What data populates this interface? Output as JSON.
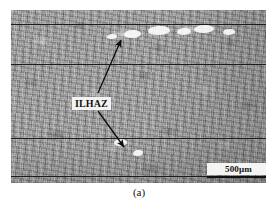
{
  "figure": {
    "caption": "(a)",
    "type": "optical-micrograph"
  },
  "micrograph": {
    "annotations": {
      "ilhaz_label": "ILHAZ",
      "ilhaz_pointer_count": 2
    },
    "scale_bar": {
      "label": "500μm",
      "value": "500",
      "unit": "μm"
    },
    "interface_lines": [
      {
        "name": "bead-boundary-1",
        "y": 14
      },
      {
        "name": "bead-boundary-2",
        "y": 54
      },
      {
        "name": "bead-boundary-3",
        "y": 128
      },
      {
        "name": "bead-boundary-4",
        "y": 166
      }
    ],
    "arrows": [
      {
        "name": "ilhaz-arrow-upper",
        "from": [
          87,
          83
        ],
        "to": [
          110,
          30
        ]
      },
      {
        "name": "ilhaz-arrow-lower",
        "from": [
          87,
          101
        ],
        "to": [
          113,
          137
        ]
      }
    ],
    "white_patches": [
      {
        "left": 113,
        "top": 20,
        "width": 17,
        "height": 8
      },
      {
        "left": 137,
        "top": 16,
        "width": 22,
        "height": 9
      },
      {
        "left": 166,
        "top": 18,
        "width": 14,
        "height": 7
      },
      {
        "left": 183,
        "top": 15,
        "width": 20,
        "height": 8
      },
      {
        "left": 212,
        "top": 19,
        "width": 12,
        "height": 6
      },
      {
        "left": 96,
        "top": 24,
        "width": 10,
        "height": 5
      },
      {
        "left": 103,
        "top": 129,
        "width": 13,
        "height": 7
      },
      {
        "left": 122,
        "top": 140,
        "width": 10,
        "height": 6
      }
    ]
  },
  "colors": {
    "background": "#ffffff",
    "matrix_gray": "#9e9e9e",
    "line_dark": "#1c1c1c",
    "label_background": "#f2f2f0",
    "text_dark": "#111111"
  }
}
